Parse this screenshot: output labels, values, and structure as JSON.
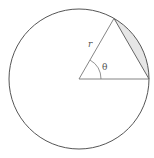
{
  "diagram": {
    "labels": {
      "radius": "r",
      "angle": "θ"
    },
    "colors": {
      "circle_stroke": "#555555",
      "triangle_stroke": "#777777",
      "segment_fill": "#e6e6e6",
      "background": "#ffffff"
    },
    "geometry": {
      "center": [
        79,
        79
      ],
      "radius": 70,
      "angle_deg": 60
    }
  }
}
